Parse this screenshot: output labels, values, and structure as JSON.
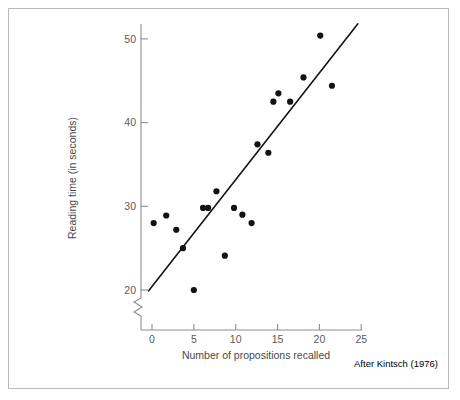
{
  "figure": {
    "caption": "After Kintsch (1976)"
  },
  "chart_data": {
    "type": "scatter",
    "title": "",
    "xlabel": "Number of propositions recalled",
    "ylabel": "Reading time (in seconds)",
    "xlim": [
      -1.5,
      26
    ],
    "ylim": [
      18.5,
      51.5
    ],
    "xticks": [
      0,
      5,
      10,
      15,
      20,
      25
    ],
    "xtick_labels": [
      "0",
      "5",
      "10",
      "15",
      "20",
      "25"
    ],
    "yticks": [
      20,
      30,
      40,
      50
    ],
    "ytick_labels": [
      "20",
      "30",
      "40",
      "50"
    ],
    "y_axis_break": true,
    "grid": false,
    "legend": null,
    "series": [
      {
        "name": "observations",
        "marker": "filled-circle",
        "color": "#121212",
        "points": [
          {
            "x": 0.2,
            "y": 28.0
          },
          {
            "x": 1.7,
            "y": 28.9
          },
          {
            "x": 2.9,
            "y": 27.2
          },
          {
            "x": 3.7,
            "y": 25.0
          },
          {
            "x": 5.0,
            "y": 20.0
          },
          {
            "x": 6.1,
            "y": 29.8
          },
          {
            "x": 6.7,
            "y": 29.8
          },
          {
            "x": 7.7,
            "y": 31.8
          },
          {
            "x": 8.7,
            "y": 24.1
          },
          {
            "x": 9.8,
            "y": 29.8
          },
          {
            "x": 10.8,
            "y": 29.0
          },
          {
            "x": 11.9,
            "y": 28.0
          },
          {
            "x": 12.6,
            "y": 37.4
          },
          {
            "x": 13.9,
            "y": 36.4
          },
          {
            "x": 14.5,
            "y": 42.5
          },
          {
            "x": 15.1,
            "y": 43.5
          },
          {
            "x": 16.5,
            "y": 42.5
          },
          {
            "x": 18.1,
            "y": 45.4
          },
          {
            "x": 20.1,
            "y": 50.4
          },
          {
            "x": 21.5,
            "y": 44.4
          }
        ]
      }
    ],
    "trendline": {
      "name": "regression-line",
      "color": "#141414",
      "x_start": -0.4,
      "y_start": 19.9,
      "x_end": 24.6,
      "y_end": 51.8
    }
  }
}
